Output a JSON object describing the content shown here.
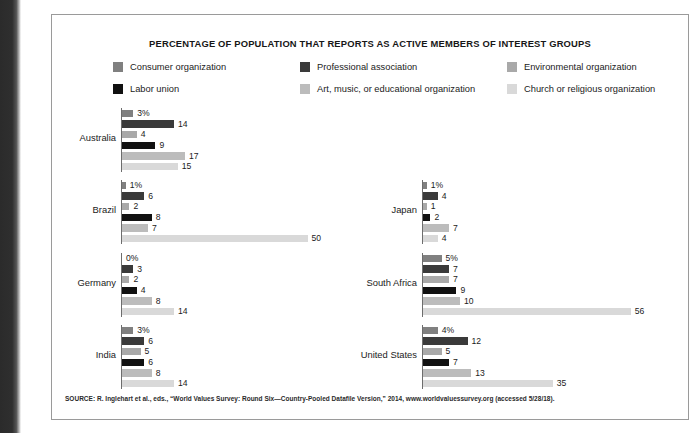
{
  "figure": {
    "title": "PERCENTAGE OF POPULATION THAT REPORTS AS  ACTIVE MEMBERS OF INTEREST GROUPS",
    "source": "SOURCE: R. Inglehart et al., eds., “World Values Survey: Round Six—Country-Pooled Datafile Version,” 2014, www.worldvaluessurvey.org (accessed 5/28/18)."
  },
  "chart_data": {
    "type": "bar",
    "orientation": "horizontal",
    "title": "PERCENTAGE OF POPULATION THAT REPORTS AS  ACTIVE MEMBERS OF INTEREST GROUPS",
    "xlabel": "",
    "ylabel": "",
    "xlim": [
      0,
      56
    ],
    "grid": false,
    "legend_position": "top",
    "value_suffix_first_series": "%",
    "categories": [
      "Australia",
      "Brazil",
      "Germany",
      "India",
      "Japan",
      "South Africa",
      "United States"
    ],
    "series": [
      {
        "name": "Consumer organization",
        "color": "#808080",
        "values": [
          3,
          1,
          0,
          3,
          1,
          5,
          4
        ]
      },
      {
        "name": "Professional association",
        "color": "#3a3a3a",
        "values": [
          14,
          6,
          3,
          6,
          4,
          7,
          12
        ]
      },
      {
        "name": "Environmental organization",
        "color": "#a9a9a9",
        "values": [
          4,
          2,
          2,
          5,
          1,
          7,
          5
        ]
      },
      {
        "name": "Labor union",
        "color": "#111111",
        "values": [
          9,
          8,
          4,
          6,
          2,
          9,
          7
        ]
      },
      {
        "name": "Art, music, or educational organization",
        "color": "#bcbcbc",
        "values": [
          17,
          7,
          8,
          8,
          7,
          10,
          13
        ]
      },
      {
        "name": "Church or religious organization",
        "color": "#d9d9d9",
        "values": [
          15,
          50,
          14,
          14,
          4,
          56,
          35
        ]
      }
    ],
    "groups": [
      {
        "country": "Australia",
        "bars": [
          {
            "series": "Consumer organization",
            "value": 3,
            "label": "3%"
          },
          {
            "series": "Professional association",
            "value": 14,
            "label": "14"
          },
          {
            "series": "Environmental organization",
            "value": 4,
            "label": "4"
          },
          {
            "series": "Labor union",
            "value": 9,
            "label": "9"
          },
          {
            "series": "Art, music, or educational organization",
            "value": 17,
            "label": "17"
          },
          {
            "series": "Church or religious organization",
            "value": 15,
            "label": "15"
          }
        ]
      },
      {
        "country": "Brazil",
        "bars": [
          {
            "series": "Consumer organization",
            "value": 1,
            "label": "1%"
          },
          {
            "series": "Professional association",
            "value": 6,
            "label": "6"
          },
          {
            "series": "Environmental organization",
            "value": 2,
            "label": "2"
          },
          {
            "series": "Labor union",
            "value": 8,
            "label": "8"
          },
          {
            "series": "Art, music, or educational organization",
            "value": 7,
            "label": "7"
          },
          {
            "series": "Church or religious organization",
            "value": 50,
            "label": "50"
          }
        ]
      },
      {
        "country": "Germany",
        "bars": [
          {
            "series": "Consumer organization",
            "value": 0,
            "label": "0%"
          },
          {
            "series": "Professional association",
            "value": 3,
            "label": "3"
          },
          {
            "series": "Environmental organization",
            "value": 2,
            "label": "2"
          },
          {
            "series": "Labor union",
            "value": 4,
            "label": "4"
          },
          {
            "series": "Art, music, or educational organization",
            "value": 8,
            "label": "8"
          },
          {
            "series": "Church or religious organization",
            "value": 14,
            "label": "14"
          }
        ]
      },
      {
        "country": "India",
        "bars": [
          {
            "series": "Consumer organization",
            "value": 3,
            "label": "3%"
          },
          {
            "series": "Professional association",
            "value": 6,
            "label": "6"
          },
          {
            "series": "Environmental organization",
            "value": 5,
            "label": "5"
          },
          {
            "series": "Labor union",
            "value": 6,
            "label": "6"
          },
          {
            "series": "Art, music, or educational organization",
            "value": 8,
            "label": "8"
          },
          {
            "series": "Church or religious organization",
            "value": 14,
            "label": "14"
          }
        ]
      },
      {
        "country": "Japan",
        "bars": [
          {
            "series": "Consumer organization",
            "value": 1,
            "label": "1%"
          },
          {
            "series": "Professional association",
            "value": 4,
            "label": "4"
          },
          {
            "series": "Environmental organization",
            "value": 1,
            "label": "1"
          },
          {
            "series": "Labor union",
            "value": 2,
            "label": "2"
          },
          {
            "series": "Art, music, or educational organization",
            "value": 7,
            "label": "7"
          },
          {
            "series": "Church or religious organization",
            "value": 4,
            "label": "4"
          }
        ]
      },
      {
        "country": "South Africa",
        "bars": [
          {
            "series": "Consumer organization",
            "value": 5,
            "label": "5%"
          },
          {
            "series": "Professional association",
            "value": 7,
            "label": "7"
          },
          {
            "series": "Environmental organization",
            "value": 7,
            "label": "7"
          },
          {
            "series": "Labor union",
            "value": 9,
            "label": "9"
          },
          {
            "series": "Art, music, or educational organization",
            "value": 10,
            "label": "10"
          },
          {
            "series": "Church or religious organization",
            "value": 56,
            "label": "56"
          }
        ]
      },
      {
        "country": "United States",
        "bars": [
          {
            "series": "Consumer organization",
            "value": 4,
            "label": "4%"
          },
          {
            "series": "Professional association",
            "value": 12,
            "label": "12"
          },
          {
            "series": "Environmental organization",
            "value": 5,
            "label": "5"
          },
          {
            "series": "Labor union",
            "value": 7,
            "label": "7"
          },
          {
            "series": "Art, music, or educational organization",
            "value": 13,
            "label": "13"
          },
          {
            "series": "Church or religious organization",
            "value": 35,
            "label": "35"
          }
        ]
      }
    ]
  },
  "layout": {
    "px_per_unit": 3.71,
    "left_column_countries": [
      "Australia",
      "Brazil",
      "Germany",
      "India"
    ],
    "right_column_countries": [
      "Japan",
      "South Africa",
      "United States"
    ]
  }
}
